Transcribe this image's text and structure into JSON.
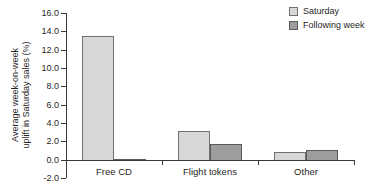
{
  "chart_data": {
    "type": "bar",
    "categories": [
      "Free CD",
      "Flight tokens",
      "Other"
    ],
    "series": [
      {
        "name": "Saturday",
        "color": "#d7d7d7",
        "border": "#707070",
        "values": [
          13.6,
          3.3,
          1.0
        ]
      },
      {
        "name": "Following week",
        "color": "#9d9d9d",
        "border": "#5a5a5a",
        "values": [
          0.1,
          1.9,
          1.2
        ]
      }
    ],
    "title": "",
    "xlabel": "",
    "ylabel": "Average week-on-week uplift in Saturday sales (%)",
    "ylabel_lines": [
      "Average week-on-week",
      "uplift in Saturday sales (%)"
    ],
    "ylim": [
      -2.0,
      16.0
    ],
    "ytick_step": 2.0,
    "yticks": [
      "16.0",
      "14.0",
      "12.0",
      "10.0",
      "8.0",
      "6.0",
      "4.0",
      "2.0",
      "0.0",
      "-2.0"
    ],
    "grid": false,
    "legend_position": "top-right",
    "colors": {
      "axis": "#3a3a3a",
      "text": "#1f1f1f",
      "background": "#ffffff"
    }
  }
}
